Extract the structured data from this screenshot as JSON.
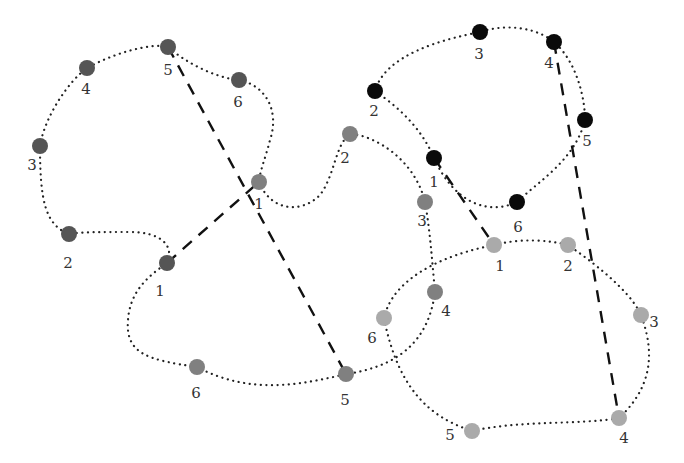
{
  "diagram": {
    "groups": [
      {
        "id": "A",
        "color": "#555555",
        "nodes": [
          {
            "label": "1",
            "x": 167,
            "y": 263,
            "lx": 160,
            "ly": 296
          },
          {
            "label": "2",
            "x": 69,
            "y": 234,
            "lx": 68,
            "ly": 268
          },
          {
            "label": "3",
            "x": 40,
            "y": 146,
            "lx": 32,
            "ly": 170
          },
          {
            "label": "4",
            "x": 87,
            "y": 68,
            "lx": 86,
            "ly": 94
          },
          {
            "label": "5",
            "x": 168,
            "y": 47,
            "lx": 168,
            "ly": 75
          },
          {
            "label": "6",
            "x": 239,
            "y": 80,
            "lx": 238,
            "ly": 107
          }
        ],
        "path": "M167,263 C175,245 160,232 130,232 C100,232 80,232 69,234 C45,225 40,200 40,146 C45,115 70,80 87,68 C110,55 150,42 168,47 C185,62 215,78 239,80 C265,85 280,110 270,140 C265,160 260,170 259,182"
      },
      {
        "id": "B",
        "color": "#808080",
        "nodes": [
          {
            "label": "1",
            "x": 259,
            "y": 182,
            "lx": 259,
            "ly": 209
          },
          {
            "label": "2",
            "x": 350,
            "y": 134,
            "lx": 345,
            "ly": 163
          },
          {
            "label": "3",
            "x": 425,
            "y": 202,
            "lx": 422,
            "ly": 226
          },
          {
            "label": "4",
            "x": 435,
            "y": 292,
            "lx": 446,
            "ly": 316
          },
          {
            "label": "5",
            "x": 346,
            "y": 374,
            "lx": 345,
            "ly": 405
          },
          {
            "label": "6",
            "x": 197,
            "y": 367,
            "lx": 196,
            "ly": 398
          }
        ],
        "path": "M259,182 C270,210 300,215 320,195 C335,175 335,145 350,134 C375,135 415,160 425,202 C430,230 432,260 435,292 C430,330 410,365 346,374 C300,385 250,395 197,367 C150,360 125,355 128,320 C130,290 150,275 167,263"
      },
      {
        "id": "C",
        "color": "#0a0a0a",
        "nodes": [
          {
            "label": "1",
            "x": 434,
            "y": 158,
            "lx": 434,
            "ly": 187
          },
          {
            "label": "2",
            "x": 375,
            "y": 91,
            "lx": 374,
            "ly": 116
          },
          {
            "label": "3",
            "x": 480,
            "y": 32,
            "lx": 479,
            "ly": 59
          },
          {
            "label": "4",
            "x": 554,
            "y": 42,
            "lx": 549,
            "ly": 68
          },
          {
            "label": "5",
            "x": 585,
            "y": 120,
            "lx": 587,
            "ly": 146
          },
          {
            "label": "6",
            "x": 517,
            "y": 202,
            "lx": 518,
            "ly": 232
          }
        ],
        "path": "M434,158 C420,125 395,105 375,91 C385,55 440,40 480,32 C510,22 540,30 554,42 C575,60 585,95 585,120 C575,160 540,180 517,202 C490,215 455,205 434,158"
      },
      {
        "id": "D",
        "color": "#aaaaaa",
        "nodes": [
          {
            "label": "1",
            "x": 494,
            "y": 245,
            "lx": 500,
            "ly": 271
          },
          {
            "label": "2",
            "x": 568,
            "y": 245,
            "lx": 568,
            "ly": 271
          },
          {
            "label": "3",
            "x": 641,
            "y": 315,
            "lx": 654,
            "ly": 327
          },
          {
            "label": "4",
            "x": 619,
            "y": 418,
            "lx": 624,
            "ly": 443
          },
          {
            "label": "5",
            "x": 472,
            "y": 431,
            "lx": 450,
            "ly": 440
          },
          {
            "label": "6",
            "x": 384,
            "y": 318,
            "lx": 372,
            "ly": 343
          }
        ],
        "path": "M494,245 C520,238 550,240 568,245 C590,260 630,290 641,315 C650,340 660,380 619,418 C580,425 520,420 472,431 C440,420 400,400 384,318 C390,290 420,260 494,245"
      }
    ],
    "links": [
      {
        "from": "A1",
        "to": "B1",
        "x1": 167,
        "y1": 263,
        "x2": 259,
        "y2": 182
      },
      {
        "from": "A5",
        "to": "B5",
        "x1": 168,
        "y1": 47,
        "x2": 346,
        "y2": 374
      },
      {
        "from": "C1",
        "to": "D1",
        "x1": 434,
        "y1": 158,
        "x2": 494,
        "y2": 245
      },
      {
        "from": "C4",
        "to": "D4",
        "x1": 554,
        "y1": 42,
        "x2": 619,
        "y2": 418
      }
    ],
    "styles": {
      "loop_stroke": "#222222",
      "link_stroke": "#111111",
      "node_radius": 8
    }
  }
}
